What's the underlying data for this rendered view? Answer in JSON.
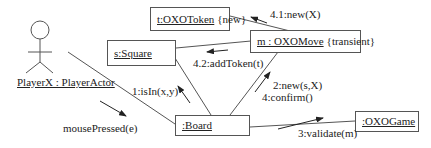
{
  "diagram": {
    "type": "UML collaboration diagram",
    "actor": {
      "name": "PlayerX : PlayerActor"
    },
    "objects": [
      {
        "id": "square",
        "name": "s:Square",
        "stereotype": ""
      },
      {
        "id": "token",
        "name": "t:OXOToken",
        "stereotype": "{new}"
      },
      {
        "id": "move",
        "name": "m : OXOMove",
        "stereotype": "{transient}"
      },
      {
        "id": "board",
        "name": ":Board",
        "stereotype": ""
      },
      {
        "id": "game",
        "name": ":OXOGame",
        "stereotype": ""
      }
    ],
    "messages": [
      {
        "label": "mousePressed(e)",
        "from": "actor",
        "to": "board"
      },
      {
        "label": "1:isIn(x,y)",
        "from": "board",
        "to": "square"
      },
      {
        "label": "2:new(s,X)",
        "from": "board",
        "to": "move"
      },
      {
        "label": "4:confirm()",
        "from": "board",
        "to": "move"
      },
      {
        "label": "3:validate(m)",
        "from": "board",
        "to": "game"
      },
      {
        "label": "4.1:new(X)",
        "from": "move",
        "to": "token"
      },
      {
        "label": "4.2:addToken(t)",
        "from": "move",
        "to": "square"
      }
    ],
    "colors": {
      "line": "#555555",
      "text": "#222222",
      "background": "#ffffff"
    }
  }
}
